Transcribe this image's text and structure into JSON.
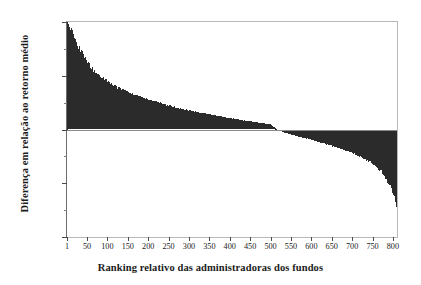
{
  "chart_data": {
    "type": "bar",
    "title": "",
    "subtitle": "",
    "xlabel": "Ranking relativo das administradoras dos fundos",
    "ylabel": "Diferença em relação ao retorno médio",
    "ylim": [
      -20.0,
      20.0
    ],
    "xlim": [
      1,
      810
    ],
    "grid": false,
    "legend": null,
    "bar_color": "#2b2b2b",
    "zero_line": 0.0,
    "y_ticks_major": [
      20.0,
      10.0,
      0.0,
      -10.0,
      -20.0
    ],
    "y_tick_labels": [
      "20.0",
      "10.0",
      "0.0",
      "-10.0",
      "-20.0"
    ],
    "y_ticks_minor": [
      15.0,
      5.0,
      -5.0,
      -15.0
    ],
    "x_ticks": [
      1,
      50,
      100,
      150,
      200,
      250,
      300,
      350,
      400,
      450,
      500,
      550,
      600,
      650,
      700,
      750,
      800
    ],
    "x_tick_labels": [
      "1",
      "50",
      "100",
      "150",
      "200",
      "250",
      "300",
      "350",
      "400",
      "450",
      "500",
      "550",
      "600",
      "650",
      "700",
      "750",
      "800"
    ],
    "n_bars": 810,
    "zero_crossing_rank": 515,
    "categories": [
      1,
      10,
      20,
      30,
      40,
      50,
      60,
      70,
      80,
      90,
      100,
      120,
      140,
      160,
      180,
      200,
      225,
      250,
      275,
      300,
      325,
      350,
      375,
      400,
      425,
      450,
      475,
      500,
      515,
      530,
      550,
      575,
      600,
      625,
      650,
      675,
      700,
      720,
      740,
      760,
      775,
      785,
      795,
      803,
      808,
      810
    ],
    "values": [
      20.0,
      18.4,
      16.6,
      15.1,
      13.8,
      12.6,
      11.6,
      10.7,
      10.0,
      9.4,
      8.8,
      7.9,
      7.2,
      6.5,
      6.0,
      5.5,
      5.0,
      4.4,
      3.9,
      3.5,
      3.1,
      2.8,
      2.4,
      2.1,
      1.8,
      1.5,
      1.2,
      0.9,
      0.0,
      -0.4,
      -0.9,
      -1.4,
      -1.9,
      -2.4,
      -3.0,
      -3.6,
      -4.3,
      -5.0,
      -5.8,
      -6.8,
      -8.0,
      -9.2,
      -10.6,
      -12.2,
      -13.8,
      -15.2
    ]
  },
  "axes": {
    "y_title": "Diferença em relação ao retorno médio",
    "x_title": "Ranking relativo das administradoras dos fundos"
  }
}
